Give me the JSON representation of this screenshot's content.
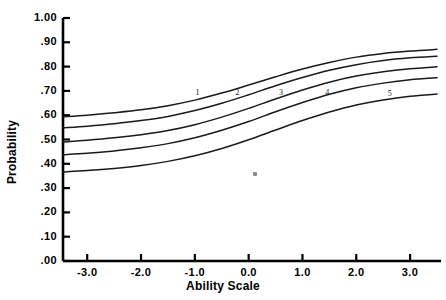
{
  "chart_data": {
    "type": "line",
    "title": "",
    "xlabel": "Ability Scale",
    "ylabel": "Probability",
    "xlim": [
      -3.45,
      3.5
    ],
    "ylim": [
      0.0,
      1.0
    ],
    "grid": false,
    "legend_position": "inline-curve-labels",
    "xticks": [
      "-3.0",
      "-2.0",
      "-1.0",
      "0.0",
      "1.0",
      "2.0",
      "3.0"
    ],
    "xtick_values": [
      -3.0,
      -2.0,
      -1.0,
      0.0,
      1.0,
      2.0,
      3.0
    ],
    "yticks": [
      "1.00",
      ".90",
      ".80",
      ".70",
      ".60",
      ".50",
      ".40",
      ".30",
      ".20",
      ".10",
      ".00"
    ],
    "ytick_values": [
      1.0,
      0.9,
      0.8,
      0.7,
      0.6,
      0.5,
      0.4,
      0.3,
      0.2,
      0.1,
      0.0
    ],
    "x": [
      -3.45,
      -3.0,
      -2.5,
      -2.0,
      -1.5,
      -1.0,
      -0.5,
      0.0,
      0.5,
      1.0,
      1.5,
      2.0,
      2.5,
      3.0,
      3.5
    ],
    "series": [
      {
        "name": "1",
        "label": "1",
        "label_x": -0.95,
        "label_y": 0.687,
        "values": [
          0.593,
          0.6,
          0.61,
          0.622,
          0.639,
          0.662,
          0.691,
          0.724,
          0.758,
          0.79,
          0.817,
          0.839,
          0.854,
          0.864,
          0.871
        ]
      },
      {
        "name": "2",
        "label": "2",
        "label_x": -0.21,
        "label_y": 0.687,
        "values": [
          0.548,
          0.555,
          0.565,
          0.578,
          0.595,
          0.619,
          0.649,
          0.684,
          0.721,
          0.755,
          0.785,
          0.808,
          0.825,
          0.836,
          0.843
        ]
      },
      {
        "name": "3",
        "label": "3",
        "label_x": 0.6,
        "label_y": 0.687,
        "values": [
          0.49,
          0.497,
          0.507,
          0.52,
          0.537,
          0.561,
          0.592,
          0.628,
          0.667,
          0.704,
          0.736,
          0.761,
          0.779,
          0.791,
          0.799
        ]
      },
      {
        "name": "4",
        "label": "4",
        "label_x": 1.46,
        "label_y": 0.687,
        "values": [
          0.437,
          0.443,
          0.453,
          0.466,
          0.483,
          0.507,
          0.538,
          0.574,
          0.614,
          0.652,
          0.686,
          0.713,
          0.732,
          0.746,
          0.754
        ]
      },
      {
        "name": "5",
        "label": "5",
        "label_x": 2.62,
        "label_y": 0.683,
        "values": [
          0.366,
          0.372,
          0.381,
          0.393,
          0.41,
          0.433,
          0.463,
          0.499,
          0.539,
          0.578,
          0.613,
          0.642,
          0.663,
          0.678,
          0.687
        ]
      }
    ]
  },
  "artifact": {
    "name": "scan-speck"
  }
}
